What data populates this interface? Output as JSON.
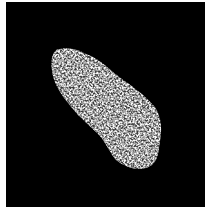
{
  "image": {
    "subject": "textured bright cell nucleus on black background",
    "background_color": "#000000",
    "border_color": "#ffffff",
    "object_color": "#d8d8d8"
  }
}
